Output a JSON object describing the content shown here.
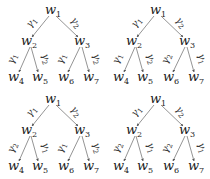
{
  "diagram": {
    "type": "binary-tree-grid",
    "edge_color": "#555555",
    "text_color": "#222222",
    "trees": [
      {
        "id": "top-left",
        "nodes": {
          "w1": "w",
          "w2": "w",
          "w3": "w",
          "w4": "w",
          "w5": "w",
          "w6": "w",
          "w7": "w"
        },
        "node_subs": {
          "w1": "1",
          "w2": "2",
          "w3": "3",
          "w4": "4",
          "w5": "5",
          "w6": "6",
          "w7": "7"
        },
        "edges": {
          "w1_w2": {
            "sym": "γ",
            "sub": "1"
          },
          "w1_w3": {
            "sym": "γ",
            "sub": "2"
          },
          "w2_w4": {
            "sym": "γ",
            "sub": "1"
          },
          "w2_w5": {
            "sym": "γ",
            "sub": "2"
          },
          "w3_w6": {
            "sym": "γ",
            "sub": "1"
          },
          "w3_w7": {
            "sym": "γ",
            "sub": "2"
          }
        }
      },
      {
        "id": "top-right",
        "nodes": {
          "w1": "w",
          "w2": "w",
          "w3": "w",
          "w4": "w",
          "w5": "w",
          "w6": "w",
          "w7": "w"
        },
        "node_subs": {
          "w1": "1",
          "w2": "2",
          "w3": "3",
          "w4": "4",
          "w5": "5",
          "w6": "6",
          "w7": "7"
        },
        "edges": {
          "w1_w2": {
            "sym": "γ",
            "sub": "1"
          },
          "w1_w3": {
            "sym": "γ",
            "sub": "2"
          },
          "w2_w4": {
            "sym": "γ",
            "sub": "1"
          },
          "w2_w5": {
            "sym": "γ",
            "sub": "2"
          },
          "w3_w6": {
            "sym": "γ",
            "sub": "2"
          },
          "w3_w7": {
            "sym": "γ",
            "sub": "1"
          }
        }
      },
      {
        "id": "bottom-left",
        "nodes": {
          "w1": "w",
          "w2": "w",
          "w3": "w",
          "w4": "w",
          "w5": "w",
          "w6": "w",
          "w7": "w"
        },
        "node_subs": {
          "w1": "1",
          "w2": "2",
          "w3": "3",
          "w4": "4",
          "w5": "5",
          "w6": "6",
          "w7": "7"
        },
        "edges": {
          "w1_w2": {
            "sym": "γ",
            "sub": "1"
          },
          "w1_w3": {
            "sym": "γ",
            "sub": "2"
          },
          "w2_w4": {
            "sym": "γ",
            "sub": "2"
          },
          "w2_w5": {
            "sym": "γ",
            "sub": "1"
          },
          "w3_w6": {
            "sym": "γ",
            "sub": "1"
          },
          "w3_w7": {
            "sym": "γ",
            "sub": "2"
          }
        }
      },
      {
        "id": "bottom-right",
        "nodes": {
          "w1": "w",
          "w2": "w",
          "w3": "w",
          "w4": "w",
          "w5": "w",
          "w6": "w",
          "w7": "w"
        },
        "node_subs": {
          "w1": "1",
          "w2": "2",
          "w3": "3",
          "w4": "4",
          "w5": "5",
          "w6": "6",
          "w7": "7"
        },
        "edges": {
          "w1_w2": {
            "sym": "γ",
            "sub": "1"
          },
          "w1_w3": {
            "sym": "γ",
            "sub": "2"
          },
          "w2_w4": {
            "sym": "γ",
            "sub": "2"
          },
          "w2_w5": {
            "sym": "γ",
            "sub": "1"
          },
          "w3_w6": {
            "sym": "γ",
            "sub": "2"
          },
          "w3_w7": {
            "sym": "γ",
            "sub": "1"
          }
        }
      }
    ]
  }
}
